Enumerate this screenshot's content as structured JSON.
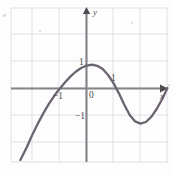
{
  "figure": {
    "title": "",
    "axis_labels": {
      "x": "x",
      "y": "y"
    },
    "origin_label": "0",
    "x_tick_labels": [
      "−1",
      "1"
    ],
    "y_tick_labels": [
      "1",
      "−1"
    ],
    "colors": {
      "curve": "#6b6470",
      "axis": "#7a7a80",
      "grid": "#d7d7dd",
      "text": "#4b4b50",
      "background": "#fdfdfd"
    }
  },
  "chart_data": {
    "type": "line",
    "title": "",
    "xlabel": "x",
    "ylabel": "y",
    "xlim": [
      -2.78,
      3.04
    ],
    "ylim": [
      -2.96,
      2.74
    ],
    "xticks": [
      -1,
      1
    ],
    "yticks": [
      -1,
      1
    ],
    "xtick_labels": [
      "−1",
      "1"
    ],
    "ytick_labels": [
      "−1",
      "1"
    ],
    "grid": true,
    "grid_spacing": 1,
    "legend": "none",
    "annotations": [
      "0"
    ],
    "series": [
      {
        "name": "curve",
        "description": "cubic-like curve rising from lower left, local maximum near (0, 0.85), local minimum near (1.8, -1.25), rising to the right",
        "x": [
          -2.45,
          -2.2,
          -2.0,
          -1.8,
          -1.6,
          -1.4,
          -1.2,
          -1.0,
          -0.8,
          -0.6,
          -0.4,
          -0.2,
          0.0,
          0.2,
          0.4,
          0.6,
          0.8,
          1.0,
          1.2,
          1.4,
          1.6,
          1.8,
          2.0,
          2.2,
          2.4,
          2.6,
          2.8,
          3.0
        ],
        "y": [
          -2.65,
          -2.15,
          -1.7,
          -1.3,
          -0.92,
          -0.58,
          -0.28,
          -0.02,
          0.22,
          0.44,
          0.62,
          0.76,
          0.85,
          0.88,
          0.84,
          0.72,
          0.5,
          0.2,
          -0.18,
          -0.6,
          -0.98,
          -1.22,
          -1.3,
          -1.24,
          -1.05,
          -0.76,
          -0.4,
          0.02
        ],
        "local_max": [
          0.1,
          0.88
        ],
        "local_min": [
          2.0,
          -1.3
        ],
        "x_intercepts": [
          -0.98,
          1.1
        ],
        "y_intercept": 0.85
      }
    ]
  }
}
